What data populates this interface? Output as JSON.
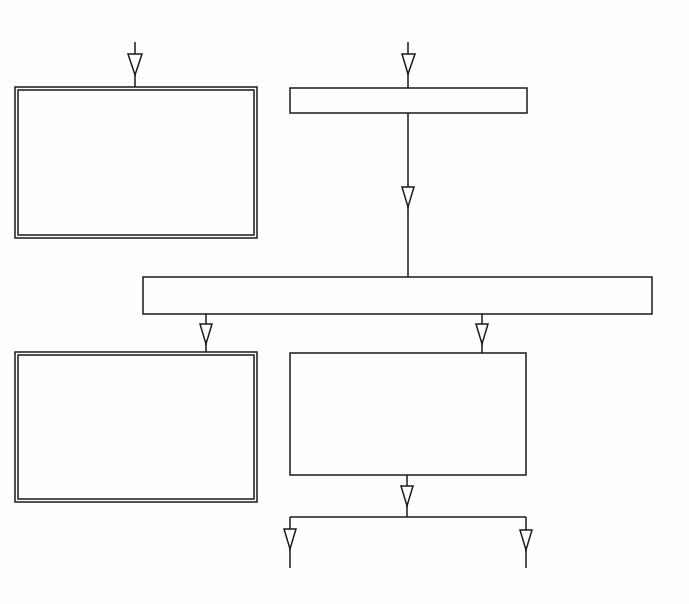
{
  "diagram": {
    "type": "flowchart",
    "stroke_color": "#1a1a1a",
    "background": "#fefefe",
    "boxes": [
      {
        "id": "box-top-left",
        "style": "double",
        "x": 15,
        "y": 87,
        "w": 242,
        "h": 151
      },
      {
        "id": "box-top-right",
        "style": "single",
        "x": 290,
        "y": 88,
        "w": 237,
        "h": 25
      },
      {
        "id": "box-middle-wide",
        "style": "single",
        "x": 143,
        "y": 277,
        "w": 509,
        "h": 37
      },
      {
        "id": "box-bottom-left",
        "style": "double",
        "x": 15,
        "y": 352,
        "w": 242,
        "h": 150
      },
      {
        "id": "box-bottom-right",
        "style": "single",
        "x": 290,
        "y": 353,
        "w": 236,
        "h": 122
      }
    ],
    "labels": []
  }
}
